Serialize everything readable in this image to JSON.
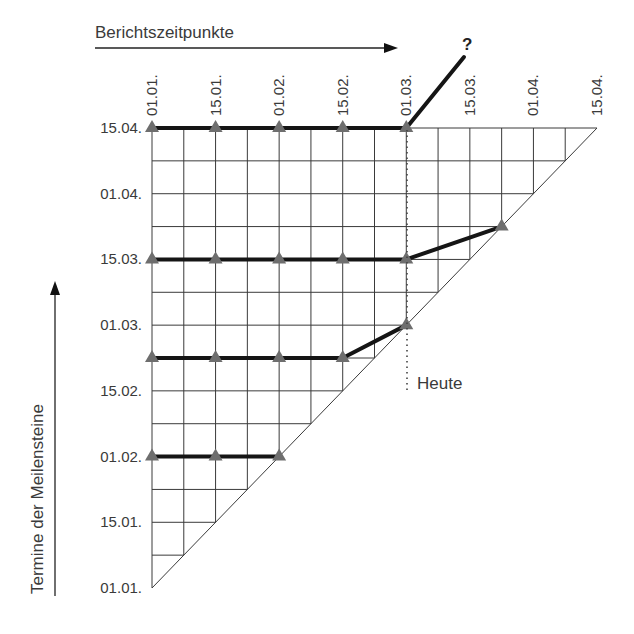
{
  "title": "Berichtszeitpunkte",
  "y_axis_title": "Termine der Meilensteine",
  "today_label": "Heute",
  "unknown_marker": "?",
  "colors": {
    "grid": "#3a3a3a",
    "milestone_line": "#151515",
    "marker": "#6e6e6e",
    "text": "#3a3a3a"
  },
  "report_dates": [
    "01.01.",
    "15.01.",
    "01.02.",
    "15.02.",
    "01.03.",
    "15.03.",
    "01.04.",
    "15.04."
  ],
  "milestone_dates": [
    "15.04.",
    "01.04.",
    "15.03.",
    "01.03.",
    "15.02.",
    "01.02.",
    "15.01.",
    "01.01."
  ],
  "chart_data": {
    "type": "line",
    "xlabel": "Berichtszeitpunkte",
    "ylabel": "Termine der Meilensteine",
    "x_ticks": [
      "01.01.",
      "15.01.",
      "01.02.",
      "15.02.",
      "01.03.",
      "15.03.",
      "01.04.",
      "15.04."
    ],
    "y_ticks": [
      "01.01.",
      "15.01.",
      "01.02.",
      "15.02.",
      "01.03.",
      "15.03.",
      "01.04.",
      "15.04."
    ],
    "grid_divisions": 14,
    "today": "01.03.",
    "series": [
      {
        "name": "Meilenstein 1",
        "points": [
          [
            "01.01.",
            "01.02."
          ],
          [
            "15.01.",
            "01.02."
          ],
          [
            "01.02.",
            "01.02."
          ]
        ]
      },
      {
        "name": "Meilenstein 2",
        "points": [
          [
            "01.01.",
            "22.02."
          ],
          [
            "15.01.",
            "22.02."
          ],
          [
            "01.02.",
            "22.02."
          ],
          [
            "15.02.",
            "22.02."
          ],
          [
            "01.03.",
            "01.03."
          ]
        ]
      },
      {
        "name": "Meilenstein 3",
        "points": [
          [
            "01.01.",
            "15.03."
          ],
          [
            "15.01.",
            "15.03."
          ],
          [
            "01.02.",
            "15.03."
          ],
          [
            "15.02.",
            "15.03."
          ],
          [
            "01.03.",
            "15.03."
          ],
          [
            "22.03.",
            "22.03."
          ]
        ]
      },
      {
        "name": "Meilenstein 4",
        "points": [
          [
            "01.01.",
            "15.04."
          ],
          [
            "15.01.",
            "15.04."
          ],
          [
            "01.02.",
            "15.04."
          ],
          [
            "15.02.",
            "15.04."
          ],
          [
            "01.03.",
            "15.04."
          ]
        ],
        "trend": "unknown (?)"
      }
    ]
  }
}
